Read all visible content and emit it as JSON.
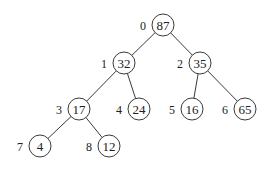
{
  "diagram": {
    "type": "binary-heap-tree",
    "nodes": [
      {
        "index": "0",
        "value": "87",
        "x": 163,
        "y": 25
      },
      {
        "index": "1",
        "value": "32",
        "x": 124,
        "y": 63
      },
      {
        "index": "2",
        "value": "35",
        "x": 200,
        "y": 63
      },
      {
        "index": "3",
        "value": "17",
        "x": 79,
        "y": 109
      },
      {
        "index": "4",
        "value": "24",
        "x": 139,
        "y": 109
      },
      {
        "index": "5",
        "value": "16",
        "x": 192,
        "y": 109
      },
      {
        "index": "6",
        "value": "65",
        "x": 245,
        "y": 109
      },
      {
        "index": "7",
        "value": "4",
        "x": 40,
        "y": 146
      },
      {
        "index": "8",
        "value": "12",
        "x": 109,
        "y": 146
      }
    ],
    "edges": [
      [
        0,
        1
      ],
      [
        0,
        2
      ],
      [
        1,
        3
      ],
      [
        1,
        4
      ],
      [
        2,
        5
      ],
      [
        2,
        6
      ],
      [
        3,
        7
      ],
      [
        3,
        8
      ]
    ]
  }
}
